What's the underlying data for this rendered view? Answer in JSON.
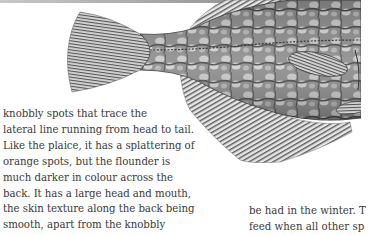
{
  "page": {
    "image": {
      "subject": "flounder-illustration",
      "palette": {
        "body_dark": "#3c3c3c",
        "body_mid": "#8a8a8a",
        "body_light": "#d8d8d8",
        "fin": "#6e6e6e"
      }
    },
    "left_column": {
      "lines": [
        "knobbly spots that trace the",
        "lateral line running from head to tail.",
        "Like the plaice, it has a splattering of",
        "orange spots, but the flounder is",
        "much darker in colour across the",
        "back. It has a large head and mouth,",
        "the skin texture along the back being",
        "smooth, apart from the knobbly"
      ]
    },
    "right_column": {
      "lines": [
        "be had in the winter. T",
        "feed when all other sp"
      ]
    }
  }
}
